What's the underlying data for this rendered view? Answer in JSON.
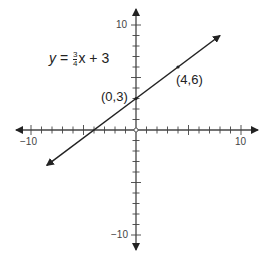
{
  "chart_data": {
    "type": "line",
    "title": "",
    "equation": {
      "lhs": "y",
      "eq": "=",
      "num": "3",
      "den": "4",
      "var": "x",
      "rest": "+ 3"
    },
    "series": [
      {
        "name": "y = 3/4x + 3",
        "x": [
          -8.5,
          8
        ],
        "y": [
          -3.375,
          9
        ]
      }
    ],
    "points": [
      {
        "label": "(0,3)",
        "x": 0,
        "y": 3
      },
      {
        "label": "(4,6)",
        "x": 4,
        "y": 6
      }
    ],
    "xlim": [
      -10,
      10
    ],
    "ylim": [
      -10,
      10
    ],
    "x_tick_labels": [
      "-10",
      "10"
    ],
    "y_tick_labels": [
      "10",
      "-10"
    ],
    "xlabel": "",
    "ylabel": "",
    "grid": false
  },
  "labels": {
    "xmin": "−10",
    "xmax": "10",
    "ymax": "10",
    "ymin": "−10",
    "p1": "(0,3)",
    "p2": "(4,6)"
  }
}
